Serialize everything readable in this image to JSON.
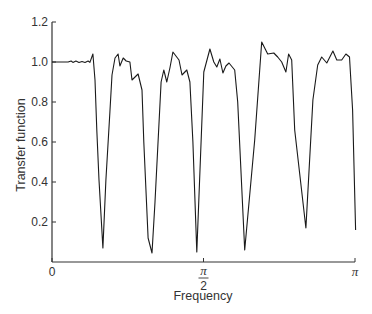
{
  "chart_data": {
    "type": "line",
    "title": "",
    "xlabel": "Frequency",
    "ylabel": "Transfer function",
    "xlim": [
      0,
      3.14159
    ],
    "ylim": [
      0,
      1.2
    ],
    "grid": false,
    "legend": null,
    "x_ticks": [
      {
        "value_over_pi": 0,
        "label": "0"
      },
      {
        "value_over_pi": 0.5,
        "label_num": "π",
        "label_den": "2"
      },
      {
        "value_over_pi": 1,
        "label": "π"
      }
    ],
    "y_ticks": [
      {
        "value": 0.2,
        "label": "0.2"
      },
      {
        "value": 0.4,
        "label": "0.4"
      },
      {
        "value": 0.6,
        "label": "0.6"
      },
      {
        "value": 0.8,
        "label": "0.8"
      },
      {
        "value": 1.0,
        "label": "1.0"
      },
      {
        "value": 1.2,
        "label": "1.2"
      }
    ],
    "series": [
      {
        "name": "Transfer function",
        "x_over_pi": [
          0.0,
          0.053,
          0.063,
          0.069,
          0.079,
          0.089,
          0.099,
          0.109,
          0.119,
          0.125,
          0.135,
          0.142,
          0.148,
          0.155,
          0.168,
          0.178,
          0.191,
          0.198,
          0.208,
          0.218,
          0.224,
          0.235,
          0.245,
          0.257,
          0.264,
          0.284,
          0.297,
          0.303,
          0.317,
          0.33,
          0.34,
          0.36,
          0.369,
          0.379,
          0.389,
          0.399,
          0.419,
          0.429,
          0.445,
          0.455,
          0.465,
          0.478,
          0.501,
          0.521,
          0.534,
          0.544,
          0.554,
          0.564,
          0.574,
          0.584,
          0.603,
          0.613,
          0.636,
          0.669,
          0.692,
          0.712,
          0.732,
          0.745,
          0.758,
          0.772,
          0.781,
          0.791,
          0.801,
          0.838,
          0.861,
          0.877,
          0.89,
          0.907,
          0.927,
          0.94,
          0.956,
          0.97,
          0.982,
          0.992,
          1.002
        ],
        "values": [
          1.0,
          1.0,
          1.005,
          0.998,
          1.005,
          0.998,
          1.003,
          0.998,
          1.005,
          0.998,
          1.04,
          0.91,
          0.66,
          0.41,
          0.07,
          0.41,
          0.75,
          0.935,
          1.02,
          1.04,
          0.98,
          1.02,
          1.005,
          1.0,
          0.91,
          0.94,
          0.86,
          0.6,
          0.12,
          0.045,
          0.3,
          0.9,
          0.96,
          0.9,
          0.97,
          1.05,
          1.01,
          0.935,
          0.96,
          0.9,
          0.6,
          0.05,
          0.95,
          1.065,
          1.0,
          0.975,
          1.015,
          0.945,
          0.98,
          0.995,
          0.96,
          0.8,
          0.06,
          0.61,
          1.1,
          1.04,
          1.045,
          1.025,
          1.0,
          0.95,
          1.04,
          1.01,
          0.66,
          0.17,
          0.81,
          0.985,
          1.025,
          0.995,
          1.055,
          1.01,
          1.01,
          1.04,
          1.025,
          0.76,
          0.16
        ],
        "color": "#1a1a1a"
      }
    ]
  }
}
